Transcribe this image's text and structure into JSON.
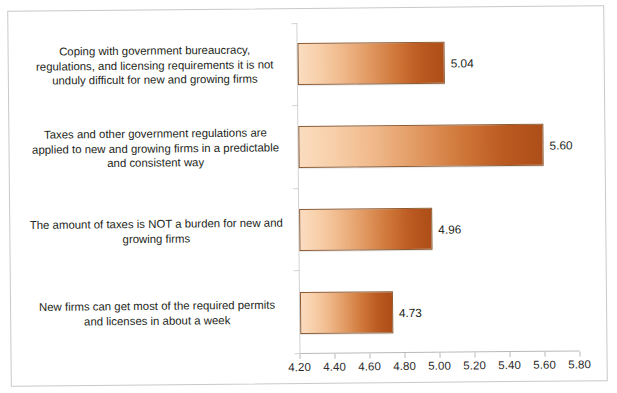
{
  "chart_data": {
    "type": "bar",
    "orientation": "horizontal",
    "title": "",
    "subtitle": "",
    "xlabel": "",
    "ylabel": "",
    "xlim": [
      4.2,
      5.8
    ],
    "xticks": [
      "4.20",
      "4.40",
      "4.60",
      "4.80",
      "5.00",
      "5.20",
      "5.40",
      "5.60",
      "5.80"
    ],
    "xtick_values": [
      4.2,
      4.4,
      4.6,
      4.8,
      5.0,
      5.2,
      5.4,
      5.6,
      5.8
    ],
    "grid": false,
    "legend": false,
    "data_labels": true,
    "categories": [
      "Coping with government bureaucracy, regulations, and licensing requirements it is not unduly difficult for new and growing firms",
      "Taxes and other government regulations are applied to new and growing firms in a predictable and consistent way",
      "The amount of taxes is NOT a burden for new and growing firms",
      "New firms can get most of the required permits and licenses in about a week"
    ],
    "values": [
      5.04,
      5.6,
      4.96,
      4.73
    ],
    "value_labels": [
      "5.04",
      "5.60",
      "4.96",
      "4.73"
    ],
    "bar_colors": {
      "gradient_start": "#FBDCC0",
      "gradient_end": "#AD4E18",
      "border": "#8D5B33"
    }
  },
  "axis": {
    "tick_labels": [
      "4.20",
      "4.40",
      "4.60",
      "4.80",
      "5.00",
      "5.20",
      "5.40",
      "5.60",
      "5.80"
    ]
  },
  "categories": [
    {
      "lines": [
        "Coping with government bureaucracy,",
        "regulations, and licensing requirements it is not",
        "unduly difficult for new and growing firms"
      ],
      "value_label": "5.04"
    },
    {
      "lines": [
        "Taxes and other government regulations are",
        "applied to new and growing firms in a predictable",
        "and consistent way"
      ],
      "value_label": "5.60"
    },
    {
      "lines": [
        "The amount of taxes is NOT a burden for new and",
        "growing firms"
      ],
      "value_label": "4.96"
    },
    {
      "lines": [
        "New firms can get most of the required permits",
        "and licenses in about a week"
      ],
      "value_label": "4.73"
    }
  ]
}
